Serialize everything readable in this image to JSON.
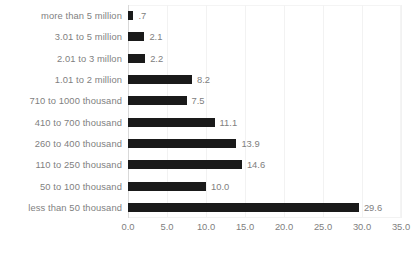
{
  "chart_data": {
    "type": "bar",
    "orientation": "horizontal",
    "title": "",
    "subtitle": "",
    "xlabel": "",
    "ylabel": "",
    "xlim": [
      0,
      35
    ],
    "xtick_step": 5,
    "grid": true,
    "legend": "none",
    "bar_color": "#1a1a1a",
    "label_color": "#7f7f7f",
    "value_color": "#808080",
    "gridline_color": "#f2f2f2",
    "axis_color": "#d9d9d9",
    "categories": [
      "more than 5 million",
      "3.01 to 5 million",
      "2.01 to 3 millon",
      "1.01 to 2 million",
      "710 to 1000 thousand",
      "410 to 700 thousand",
      "260 to 400 thousand",
      "110 to 250 thousand",
      "50 to 100 thousand",
      "less than 50 thousand"
    ],
    "values": [
      0.7,
      2.1,
      2.2,
      8.2,
      7.5,
      11.1,
      13.9,
      14.6,
      10.0,
      29.6
    ],
    "value_labels": [
      ".7",
      "2.1",
      "2.2",
      "8.2",
      "7.5",
      "11.1",
      "13.9",
      "14.6",
      "10.0",
      "29.6"
    ],
    "xticks": [
      0,
      5,
      10,
      15,
      20,
      25,
      30,
      35
    ],
    "xtick_labels": [
      "0.0",
      "5.0",
      "10.0",
      "15.0",
      "20.0",
      "25.0",
      "30.0",
      "35.0"
    ]
  }
}
